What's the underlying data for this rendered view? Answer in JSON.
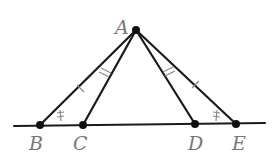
{
  "diagram": {
    "type": "geometry",
    "points": [
      {
        "name": "A",
        "x": 136,
        "y": 30
      },
      {
        "name": "B",
        "x": 40,
        "y": 125
      },
      {
        "name": "C",
        "x": 83,
        "y": 125
      },
      {
        "name": "D",
        "x": 195,
        "y": 124
      },
      {
        "name": "E",
        "x": 236,
        "y": 124
      }
    ],
    "labels": {
      "A": "A",
      "B": "B",
      "C": "C",
      "D": "D",
      "E": "E"
    },
    "segments": [
      "AB",
      "AC",
      "AD",
      "AE",
      "line BE"
    ],
    "congruence_marks": {
      "AB": "single tick",
      "AE": "single tick",
      "AC": "double tick",
      "AD": "double tick",
      "angle_B": "double arc mark",
      "angle_E": "double arc mark"
    }
  }
}
